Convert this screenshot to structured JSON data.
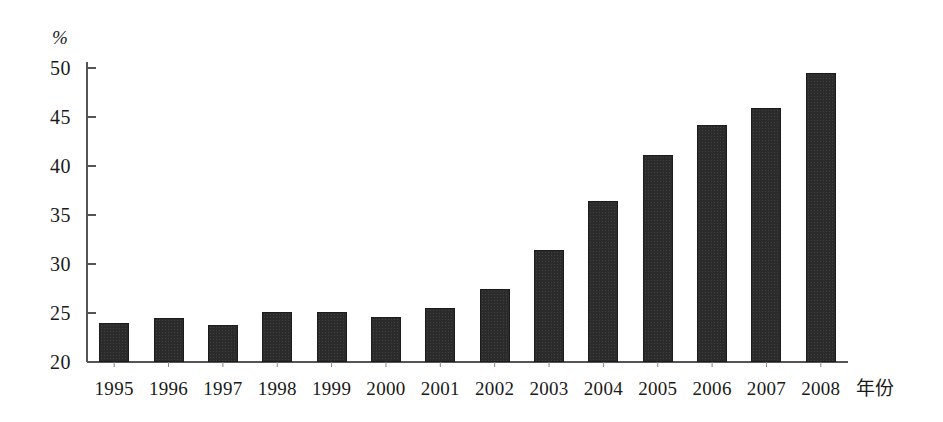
{
  "chart_data": {
    "type": "bar",
    "title": "",
    "subtitle": "",
    "xlabel": "年份",
    "ylabel": "%",
    "categories": [
      "1995",
      "1996",
      "1997",
      "1998",
      "1999",
      "2000",
      "2001",
      "2002",
      "2003",
      "2004",
      "2005",
      "2006",
      "2007",
      "2008"
    ],
    "values": [
      24.0,
      24.5,
      23.8,
      25.1,
      25.1,
      24.6,
      25.5,
      27.4,
      31.4,
      36.4,
      41.1,
      44.2,
      45.9,
      49.5
    ],
    "ylim": [
      20,
      50
    ],
    "y_ticks": [
      "20",
      "25",
      "30",
      "35",
      "40",
      "45",
      "50"
    ],
    "y_tick_values": [
      20,
      25,
      30,
      35,
      40,
      45,
      50
    ],
    "grid": false,
    "legend": null,
    "legend_position": "none",
    "annotations": [],
    "series_color": "#2b2b2b",
    "axis_color": "#555555"
  },
  "axis": {
    "unit_label": "%",
    "x_title": "年份"
  }
}
